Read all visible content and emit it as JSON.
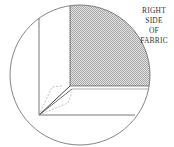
{
  "label": {
    "lines": [
      "RIGHT",
      "SIDE",
      "OF",
      "FABRIC"
    ]
  },
  "colors": {
    "line": "#555555",
    "shade_dark": "#a8a8a8",
    "shade_light": "#e0e0e0",
    "dashed": "#999999"
  }
}
